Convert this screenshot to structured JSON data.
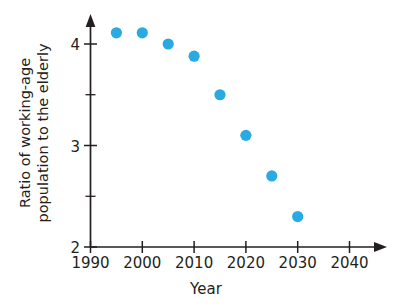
{
  "chart_data": {
    "type": "scatter",
    "title": "",
    "xlabel": "Year",
    "ylabel": "Ratio of working-age population to the elderly",
    "ylabel_lines": [
      "Ratio of working-age",
      "population to the elderly"
    ],
    "x": [
      1995,
      2000,
      2005,
      2010,
      2015,
      2020,
      2025,
      2030
    ],
    "values": [
      4.11,
      4.11,
      4.0,
      3.88,
      3.5,
      3.1,
      2.7,
      2.3
    ],
    "points": [
      {
        "x": 1995,
        "y": 4.11
      },
      {
        "x": 2000,
        "y": 4.11
      },
      {
        "x": 2005,
        "y": 4.0
      },
      {
        "x": 2010,
        "y": 3.88
      },
      {
        "x": 2015,
        "y": 3.5
      },
      {
        "x": 2020,
        "y": 3.1
      },
      {
        "x": 2025,
        "y": 2.7
      },
      {
        "x": 2030,
        "y": 2.3
      }
    ],
    "xlim": [
      1990,
      2045
    ],
    "ylim": [
      2,
      4.3
    ],
    "xticks": [
      1990,
      2000,
      2010,
      2020,
      2030,
      2040
    ],
    "xtick_labels": [
      "1990",
      "2000",
      "2010",
      "2020",
      "2030",
      "2040"
    ],
    "yticks": [
      2,
      3,
      4
    ],
    "ytick_labels": [
      "2",
      "3",
      "4"
    ],
    "y_minor_ticks": [
      2.5,
      3.5
    ],
    "grid": false,
    "legend": null,
    "marker_color": "#29abe2",
    "axis_color": "#231f20",
    "x_axis_arrow": true,
    "y_axis_arrow": true
  }
}
